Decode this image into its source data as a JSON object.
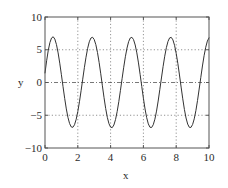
{
  "chart_data": {
    "type": "line",
    "title": "",
    "subtitle": "",
    "xlabel": "x",
    "ylabel": "y",
    "xlim": [
      0,
      10
    ],
    "ylim": [
      -10,
      10
    ],
    "xticks": [
      "0",
      "2",
      "4",
      "6",
      "8",
      "10"
    ],
    "xtick_values": [
      0,
      2,
      4,
      6,
      8,
      10
    ],
    "yticks": [
      "10",
      "5",
      "0",
      "−5",
      "−10"
    ],
    "ytick_values": [
      10,
      5,
      0,
      -5,
      -10
    ],
    "grid": {
      "vertical_lines_at": [
        2,
        4,
        6,
        8
      ],
      "vertical_style": "dotted",
      "horizontal_lines_at": [
        5,
        -5
      ],
      "horizontal_style": "dotted",
      "zero_line_at": 0,
      "zero_line_style": "dash-dot"
    },
    "legend": {
      "visible": false,
      "position": "none",
      "entries": []
    },
    "annotations": [],
    "series": [
      {
        "name": "y(x)",
        "color": "#333333",
        "line_width": 1,
        "description": "Oscillating sinusoid, amplitude about 7, five peaks between x=0 and x=10, period about 2.1, starts near y=1.5 at x=0 and ends near y=-7 at x=10",
        "amplitude": 7,
        "period": 2.1,
        "phase_deg": 12,
        "peaks": [
          {
            "x": 0.52,
            "y": 7.0
          },
          {
            "x": 2.62,
            "y": 7.0
          },
          {
            "x": 4.72,
            "y": 7.0
          },
          {
            "x": 6.82,
            "y": 7.0
          },
          {
            "x": 8.92,
            "y": 7.0
          }
        ],
        "troughs": [
          {
            "x": 1.57,
            "y": -7.0
          },
          {
            "x": 3.67,
            "y": -7.0
          },
          {
            "x": 5.77,
            "y": -7.0
          },
          {
            "x": 7.87,
            "y": -7.0
          },
          {
            "x": 9.97,
            "y": -7.0
          }
        ],
        "x": [
          0.0,
          0.1,
          0.2,
          0.3,
          0.4,
          0.5,
          0.6,
          0.7,
          0.8,
          0.9,
          1.0,
          1.1,
          1.2,
          1.3,
          1.4,
          1.5,
          1.6,
          1.7,
          1.8,
          1.9,
          2.0,
          2.1,
          2.2,
          2.3,
          2.4,
          2.5,
          2.6,
          2.7,
          2.8,
          2.9,
          3.0,
          3.1,
          3.2,
          3.3,
          3.4,
          3.5,
          3.6,
          3.7,
          3.8,
          3.9,
          4.0,
          4.1,
          4.2,
          4.3,
          4.4,
          4.5,
          4.6,
          4.7,
          4.8,
          4.9,
          5.0,
          5.1,
          5.2,
          5.3,
          5.4,
          5.5,
          5.6,
          5.7,
          5.8,
          5.9,
          6.0,
          6.1,
          6.2,
          6.3,
          6.4,
          6.5,
          6.6,
          6.7,
          6.8,
          6.9,
          7.0,
          7.1,
          7.2,
          7.3,
          7.4,
          7.5,
          7.6,
          7.7,
          7.8,
          7.9,
          8.0,
          8.1,
          8.2,
          8.3,
          8.4,
          8.5,
          8.6,
          8.7,
          8.8,
          8.9,
          9.0,
          9.1,
          9.2,
          9.3,
          9.4,
          9.5,
          9.6,
          9.7,
          9.8,
          9.9,
          10.0
        ],
        "y": [
          1.46,
          3.32,
          4.92,
          6.1,
          6.8,
          6.98,
          6.63,
          5.78,
          4.52,
          2.95,
          1.19,
          -0.64,
          -2.42,
          -4.03,
          -5.34,
          -6.27,
          -6.78,
          -6.84,
          -6.45,
          -5.63,
          -4.44,
          -2.95,
          -1.26,
          0.51,
          2.26,
          3.86,
          5.21,
          6.21,
          6.79,
          6.91,
          6.57,
          5.78,
          4.59,
          3.07,
          1.33,
          -0.51,
          -2.32,
          -3.97,
          -5.32,
          -6.29,
          -6.82,
          -6.89,
          -6.49,
          -5.66,
          -4.44,
          -2.92,
          -1.2,
          0.58,
          2.33,
          3.93,
          5.26,
          6.24,
          6.8,
          6.9,
          6.54,
          5.73,
          4.52,
          2.99,
          1.24,
          -0.6,
          -2.4,
          -4.04,
          -5.37,
          -6.32,
          -6.83,
          -6.87,
          -6.45,
          -5.6,
          -4.37,
          -2.83,
          -1.09,
          0.69,
          2.43,
          4.01,
          5.32,
          6.28,
          6.81,
          6.89,
          6.51,
          5.68,
          4.45,
          2.91,
          1.15,
          -0.7,
          -2.49,
          -4.11,
          -5.42,
          -6.35,
          -6.84,
          -6.86,
          -6.41,
          -5.55,
          -4.3,
          -2.75,
          -1.0,
          0.78,
          2.52,
          4.09,
          5.38,
          6.32,
          6.82
        ]
      }
    ]
  },
  "axis_geometry": {
    "left_px": 45,
    "right_px": 209,
    "top_px": 17,
    "bottom_px": 148,
    "frame_color": "#555555"
  }
}
